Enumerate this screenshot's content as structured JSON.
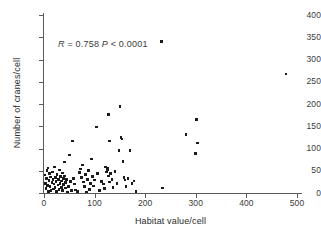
{
  "chart_data": {
    "type": "scatter",
    "title": "",
    "xlabel": "Habitat value/cell",
    "ylabel": "Number of cranes/cell",
    "xlim": [
      0,
      520
    ],
    "ylim": [
      0,
      415
    ],
    "xticks": [
      0,
      100,
      200,
      300,
      400,
      500
    ],
    "yticks": [
      0,
      50,
      100,
      150,
      200,
      250,
      300,
      350,
      400
    ],
    "grid": false,
    "legend": null,
    "annotations": [
      {
        "text": "R = 0.758 P < 0.0001",
        "parts": [
          "R",
          " = 0.758  ",
          "P",
          " < 0.0001"
        ],
        "x": 30,
        "y": 345
      }
    ],
    "statistics": {
      "R": 0.758,
      "P": "< 0.0001"
    },
    "marker": "square",
    "marker_color": "#1b1b1b",
    "points": [
      [
        2,
        40
      ],
      [
        3,
        22
      ],
      [
        4,
        10
      ],
      [
        5,
        33
      ],
      [
        6,
        50
      ],
      [
        7,
        17
      ],
      [
        8,
        56
      ],
      [
        9,
        4
      ],
      [
        10,
        28
      ],
      [
        11,
        44
      ],
      [
        12,
        14
      ],
      [
        13,
        36
      ],
      [
        14,
        6
      ],
      [
        16,
        24
      ],
      [
        17,
        47
      ],
      [
        18,
        31
      ],
      [
        19,
        9
      ],
      [
        20,
        20
      ],
      [
        21,
        58
      ],
      [
        22,
        13
      ],
      [
        23,
        35
      ],
      [
        24,
        26
      ],
      [
        25,
        3
      ],
      [
        26,
        41
      ],
      [
        28,
        18
      ],
      [
        29,
        30
      ],
      [
        30,
        8
      ],
      [
        31,
        52
      ],
      [
        32,
        22
      ],
      [
        33,
        37
      ],
      [
        34,
        12
      ],
      [
        35,
        27
      ],
      [
        36,
        45
      ],
      [
        37,
        5
      ],
      [
        38,
        33
      ],
      [
        39,
        19
      ],
      [
        40,
        70
      ],
      [
        41,
        38
      ],
      [
        42,
        24
      ],
      [
        43,
        11
      ],
      [
        44,
        30
      ],
      [
        46,
        2
      ],
      [
        48,
        15
      ],
      [
        50,
        85
      ],
      [
        52,
        26
      ],
      [
        54,
        5
      ],
      [
        56,
        117
      ],
      [
        58,
        33
      ],
      [
        60,
        20
      ],
      [
        62,
        7
      ],
      [
        66,
        3
      ],
      [
        70,
        46
      ],
      [
        72,
        54
      ],
      [
        74,
        35
      ],
      [
        76,
        63
      ],
      [
        78,
        25
      ],
      [
        80,
        14
      ],
      [
        82,
        42
      ],
      [
        84,
        2
      ],
      [
        86,
        30
      ],
      [
        88,
        51
      ],
      [
        90,
        8
      ],
      [
        92,
        22
      ],
      [
        94,
        76
      ],
      [
        96,
        37
      ],
      [
        98,
        16
      ],
      [
        100,
        29
      ],
      [
        104,
        148
      ],
      [
        106,
        44
      ],
      [
        110,
        5
      ],
      [
        114,
        26
      ],
      [
        118,
        20
      ],
      [
        120,
        10
      ],
      [
        122,
        58
      ],
      [
        124,
        47
      ],
      [
        125,
        52
      ],
      [
        126,
        55
      ],
      [
        127,
        38
      ],
      [
        128,
        177
      ],
      [
        129,
        117
      ],
      [
        130,
        25
      ],
      [
        132,
        44
      ],
      [
        134,
        31
      ],
      [
        136,
        13
      ],
      [
        140,
        48
      ],
      [
        144,
        22
      ],
      [
        148,
        95
      ],
      [
        150,
        194
      ],
      [
        152,
        125
      ],
      [
        154,
        121
      ],
      [
        156,
        71
      ],
      [
        158,
        35
      ],
      [
        160,
        29
      ],
      [
        162,
        15
      ],
      [
        166,
        33
      ],
      [
        170,
        95
      ],
      [
        174,
        22
      ],
      [
        178,
        27
      ],
      [
        182,
        4
      ],
      [
        232,
        340
      ],
      [
        234,
        11
      ],
      [
        281,
        131
      ],
      [
        299,
        89
      ],
      [
        301,
        165
      ],
      [
        303,
        112
      ],
      [
        478,
        267
      ]
    ]
  }
}
